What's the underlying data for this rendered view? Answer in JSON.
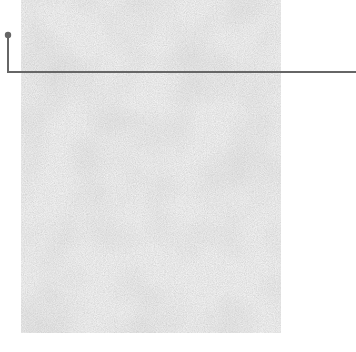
{
  "image": {
    "subject": "gray textured material swatch",
    "background_color": "#ffffff",
    "swatch": {
      "x": 21,
      "y": 0,
      "width": 260,
      "height": 333,
      "base_color": "#c6c6c6"
    },
    "annotation": {
      "type": "leader-line",
      "color": "#666666",
      "dot": {
        "cx": 8,
        "cy": 35,
        "r": 3
      },
      "path": [
        [
          8,
          35
        ],
        [
          8,
          72
        ],
        [
          356,
          72
        ]
      ]
    }
  }
}
